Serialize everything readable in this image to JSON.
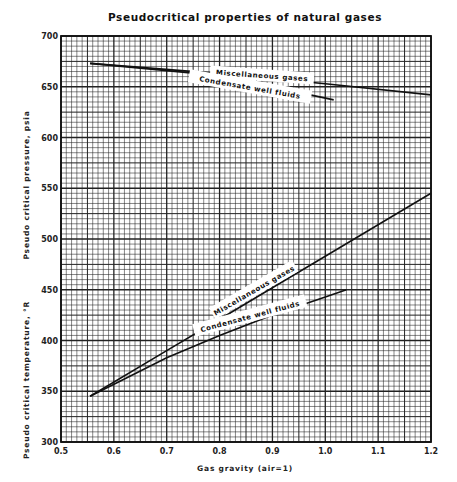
{
  "chart_data": {
    "type": "line",
    "title": "Pseudocritical properties of natural gases",
    "xlabel": "Gas gravity (air=1)",
    "ylabel_upper": "Pseudo critical pressure, psia",
    "ylabel_lower": "Pseudo critical temperature, °R",
    "xlim": [
      0.5,
      1.2
    ],
    "ylim": [
      300,
      700
    ],
    "x_ticks": [
      "0.5",
      "0.6",
      "0.7",
      "0.8",
      "0.9",
      "1.0",
      "1.1",
      "1.2"
    ],
    "y_ticks": [
      "300",
      "350",
      "400",
      "450",
      "500",
      "550",
      "600",
      "650",
      "700"
    ],
    "grid": true,
    "legend": "inline labels on curves",
    "series": [
      {
        "name": "Miscellaneous gases (pressure)",
        "label": "Miscellaneous gases",
        "x": [
          0.555,
          0.8,
          1.0,
          1.2
        ],
        "y": [
          673,
          663,
          653,
          642
        ]
      },
      {
        "name": "Condensate well fluids (pressure)",
        "label": "Condensate well fluids",
        "x": [
          0.555,
          0.8,
          1.016
        ],
        "y": [
          673,
          661,
          637
        ]
      },
      {
        "name": "Miscellaneous gases (temperature)",
        "label": "Miscellaneous gases",
        "x": [
          0.555,
          0.7,
          0.8,
          0.9,
          1.0,
          1.1,
          1.2
        ],
        "y": [
          345,
          390,
          421,
          452,
          483,
          514,
          545
        ]
      },
      {
        "name": "Condensate well fluids (temperature)",
        "label": "Condensate well fluids",
        "x": [
          0.555,
          0.7,
          0.8,
          0.9,
          1.0,
          1.04
        ],
        "y": [
          345,
          383,
          405,
          425,
          443,
          450
        ]
      }
    ]
  },
  "labels": {
    "title": "Pseudocritical properties of natural gases",
    "xlabel": "Gas gravity (air=1)",
    "ylabel_upper": "Pseudo critical pressure, psia",
    "ylabel_lower": "Pseudo critical temperature, °R",
    "misc_upper": "Miscellaneous gases",
    "cond_upper": "Condensate well fluids",
    "misc_lower": "Miscellaneous gases",
    "cond_lower": "Condensate well fluids"
  }
}
